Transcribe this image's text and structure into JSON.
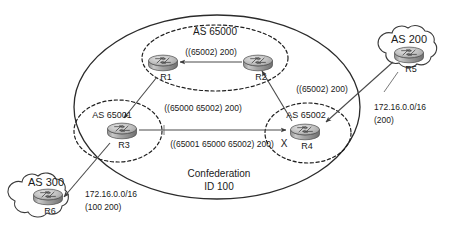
{
  "diagram": {
    "confederation": {
      "label_line1": "Confederation",
      "label_line2": "ID 100"
    },
    "member_as": [
      {
        "id": "as65000",
        "label": "AS 65000"
      },
      {
        "id": "as65001",
        "label": "AS 65001"
      },
      {
        "id": "as65002",
        "label": "AS 65002"
      }
    ],
    "external_as": [
      {
        "id": "as200",
        "label": "AS 200"
      },
      {
        "id": "as300",
        "label": "AS 300"
      }
    ],
    "routers": [
      {
        "id": "r1",
        "label": "R1"
      },
      {
        "id": "r2",
        "label": "R2"
      },
      {
        "id": "r3",
        "label": "R3"
      },
      {
        "id": "r4",
        "label": "R4"
      },
      {
        "id": "r5",
        "label": "R5"
      },
      {
        "id": "r6",
        "label": "R6"
      }
    ],
    "path_labels": [
      {
        "id": "r2-to-r1",
        "text": "((65002) 200)"
      },
      {
        "id": "r4-to-r2",
        "text": "((65002) 200)"
      },
      {
        "id": "r1-to-r3",
        "text": "((65000 65002) 200)"
      },
      {
        "id": "r3-to-r4",
        "text": "((65001 65000 65002) 200)"
      },
      {
        "id": "blocked-marker",
        "text": "X"
      }
    ],
    "prefix_annotations": [
      {
        "id": "as200-advert",
        "prefix": "172.16.0.0/16",
        "aspath": "(200)"
      },
      {
        "id": "as300-advert",
        "prefix": "172.16.0.0/16",
        "aspath": "(100 200)"
      }
    ],
    "colors": {
      "line": "#4a4a4a",
      "boundary": "#2b2b2b",
      "text": "#1a1a1a",
      "router_body": "#9a9a9a",
      "router_top": "#d8d8d8",
      "cloud_fill": "#fefefe"
    }
  }
}
